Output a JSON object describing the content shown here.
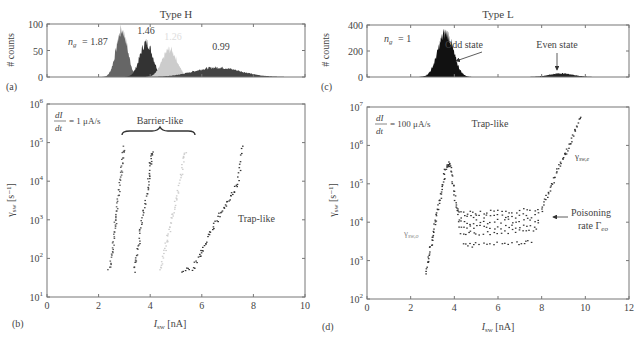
{
  "chart_data": [
    {
      "panel": "(a)",
      "type": "area",
      "title": "Type H",
      "xlabel": "",
      "ylabel": "# counts",
      "xlim": [
        0,
        10
      ],
      "ylim": [
        0,
        100
      ],
      "yticks": [
        "0",
        "50",
        "100"
      ],
      "annotations": [
        "n_g = 1.87",
        "1.46",
        "1.26",
        "0.99"
      ],
      "series": [
        {
          "name": "n_g = 1.87",
          "color": "#666666",
          "center": 2.9,
          "width": 0.22,
          "peak": 88
        },
        {
          "name": "1.46",
          "color": "#333333",
          "center": 3.85,
          "width": 0.25,
          "peak": 65
        },
        {
          "name": "1.26",
          "color": "#cccccc",
          "center": 4.75,
          "width": 0.28,
          "peak": 52
        },
        {
          "name": "0.99",
          "color": "#444444",
          "center": 6.6,
          "width": 0.9,
          "peak": 18
        }
      ]
    },
    {
      "panel": "(b)",
      "type": "scatter",
      "title": "",
      "xlabel": "I_sw [nA]",
      "ylabel": "γ_sw [s^-1]",
      "xlim": [
        0,
        10
      ],
      "ylim": [
        10,
        1000000
      ],
      "yscale": "log",
      "xticks": [
        "0",
        "2",
        "4",
        "6",
        "8",
        "10"
      ],
      "yticks": [
        "10^1",
        "10^2",
        "10^3",
        "10^4",
        "10^5",
        "10^6"
      ],
      "annotations": [
        "dI/dt = 1 μA/s",
        "Barrier-like",
        "Trap-like"
      ],
      "series": [
        {
          "name": "n_g = 1.87",
          "color": "#555555",
          "x": [
            2.4,
            2.5,
            2.55,
            2.6,
            2.65,
            2.7,
            2.75,
            2.8,
            2.85,
            2.9,
            2.95,
            3.0
          ],
          "y": [
            50,
            100,
            200,
            400,
            800,
            1500,
            3000,
            6000,
            12000,
            25000,
            50000,
            80000
          ]
        },
        {
          "name": "1.46",
          "color": "#444444",
          "x": [
            3.4,
            3.45,
            3.55,
            3.6,
            3.7,
            3.8,
            3.9,
            3.95,
            4.0,
            4.05,
            4.1
          ],
          "y": [
            50,
            100,
            200,
            500,
            1000,
            2500,
            6000,
            12000,
            25000,
            45000,
            60000
          ]
        },
        {
          "name": "1.26",
          "color": "#cccccc",
          "x": [
            4.4,
            4.5,
            4.6,
            4.7,
            4.8,
            4.9,
            5.0,
            5.1,
            5.2,
            5.3,
            5.4
          ],
          "y": [
            50,
            100,
            200,
            400,
            800,
            1500,
            3000,
            6000,
            15000,
            35000,
            70000
          ]
        },
        {
          "name": "0.99",
          "color": "#333333",
          "x": [
            5.2,
            5.6,
            5.9,
            6.0,
            6.2,
            6.4,
            6.6,
            6.8,
            7.0,
            7.2,
            7.4,
            7.5,
            7.6
          ],
          "y": [
            50,
            50,
            100,
            150,
            300,
            600,
            1000,
            1800,
            3000,
            5000,
            9000,
            30000,
            90000
          ]
        }
      ]
    },
    {
      "panel": "(c)",
      "type": "area",
      "title": "Type L",
      "xlabel": "",
      "ylabel": "# counts",
      "xlim": [
        0,
        12
      ],
      "ylim": [
        0,
        400
      ],
      "yticks": [
        "0",
        "200",
        "400"
      ],
      "annotations": [
        "n_g = 1",
        "Odd state",
        "Even state"
      ],
      "series": [
        {
          "name": "Odd state",
          "color": "#111111",
          "center": 3.6,
          "width": 0.35,
          "peak": 340
        },
        {
          "name": "Even state",
          "color": "#222222",
          "center": 8.9,
          "width": 0.55,
          "peak": 28
        }
      ]
    },
    {
      "panel": "(d)",
      "type": "scatter",
      "title": "",
      "xlabel": "I_sw [nA]",
      "ylabel": "γ_sw [s^-1]",
      "xlim": [
        0,
        12
      ],
      "ylim": [
        100,
        10000000
      ],
      "yscale": "log",
      "xticks": [
        "0",
        "2",
        "4",
        "6",
        "8",
        "10",
        "12"
      ],
      "yticks": [
        "10^2",
        "10^3",
        "10^4",
        "10^5",
        "10^6",
        "10^7"
      ],
      "annotations": [
        "dI/dt = 100 μA/s",
        "Trap-like",
        "γ_sw,o",
        "γ_sw,e",
        "Poisoning rate Γ_eo"
      ],
      "series": [
        {
          "name": "γ_sw,o",
          "color": "#333333",
          "x": [
            2.7,
            2.8,
            2.9,
            3.0,
            3.1,
            3.2,
            3.3,
            3.4,
            3.5,
            3.6,
            3.7,
            3.8,
            3.9,
            4.0,
            4.1,
            4.2
          ],
          "y": [
            500,
            1000,
            2000,
            4000,
            8000,
            15000,
            30000,
            60000,
            120000,
            250000,
            330000,
            300000,
            150000,
            60000,
            25000,
            15000
          ]
        },
        {
          "name": "Γ_eo level 1",
          "color": "#333333",
          "x": [
            4.2,
            5,
            6,
            7,
            8
          ],
          "y": [
            18000,
            18500,
            19000,
            20000,
            22000
          ]
        },
        {
          "name": "Γ_eo level 2",
          "color": "#333333",
          "x": [
            4.2,
            5,
            6,
            7,
            8
          ],
          "y": [
            13000,
            13500,
            14000,
            14500,
            15500
          ]
        },
        {
          "name": "Γ_eo level 3",
          "color": "#333333",
          "x": [
            4.2,
            5,
            6,
            7,
            8
          ],
          "y": [
            9500,
            10000,
            10500,
            11000,
            12000
          ]
        },
        {
          "name": "Γ_eo level 4",
          "color": "#333333",
          "x": [
            4.2,
            5,
            6,
            7,
            8
          ],
          "y": [
            7000,
            7300,
            7600,
            8000,
            8500
          ]
        },
        {
          "name": "Γ_eo level 5",
          "color": "#333333",
          "x": [
            4.3,
            5,
            6,
            7,
            7.9
          ],
          "y": [
            5000,
            5200,
            5500,
            5800,
            6200
          ]
        },
        {
          "name": "Γ_eo level 6",
          "color": "#333333",
          "x": [
            4.4,
            5,
            6,
            7,
            7.6
          ],
          "y": [
            2500,
            2600,
            2800,
            3000,
            3200
          ]
        },
        {
          "name": "γ_sw,e",
          "color": "#333333",
          "x": [
            8.0,
            8.2,
            8.4,
            8.6,
            8.8,
            9.0,
            9.2,
            9.4,
            9.6,
            9.8
          ],
          "y": [
            20000,
            40000,
            80000,
            150000,
            300000,
            500000,
            800000,
            1500000,
            3000000,
            6000000
          ]
        }
      ]
    }
  ],
  "labels": {
    "title_h": "Type H",
    "title_l": "Type L",
    "counts": "# counts",
    "panel_a": "(a)",
    "panel_b": "(b)",
    "panel_c": "(c)",
    "panel_d": "(d)",
    "ng_h": "= 1.87",
    "ng_l": "= 1",
    "h146": "1.46",
    "h126": "1.26",
    "h099": "0.99",
    "odd": "Odd state",
    "even": "Even state",
    "rate_b": "= 1 μA/s",
    "rate_d": "= 100 μA/s",
    "barrier": "Barrier-like",
    "trap_b": "Trap-like",
    "trap_d": "Trap-like",
    "poison1": "Poisoning",
    "poison2": "rate Γ",
    "poison_sub": "eo",
    "gamma_o_sub": "sw,o",
    "gamma_e_sub": "sw,e",
    "xlabel_sub": "sw",
    "xlabel_unit": "[nA]",
    "ylabel_unit": "[s⁻¹]",
    "ylabel_sub": "sw"
  }
}
